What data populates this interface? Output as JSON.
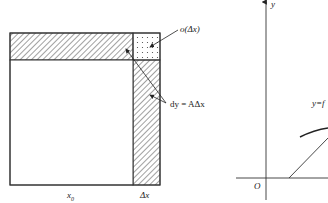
{
  "left_diagram": {
    "labels": {
      "x0": "x",
      "x0_sub": "0",
      "dx": "Δx",
      "o_dx": "o(Δx)",
      "dy": "dy = AΔx"
    },
    "regions": [
      {
        "name": "main-square",
        "fill": "white",
        "size": "x0 × x0"
      },
      {
        "name": "top-strip",
        "fill": "hatched"
      },
      {
        "name": "right-strip",
        "fill": "hatched"
      },
      {
        "name": "corner-square",
        "fill": "dotted"
      }
    ]
  },
  "right_diagram": {
    "labels": {
      "y_axis": "y",
      "origin": "O",
      "curve": "y=f"
    }
  },
  "colors": {
    "stroke": "#333333",
    "background": "#ffffff"
  }
}
